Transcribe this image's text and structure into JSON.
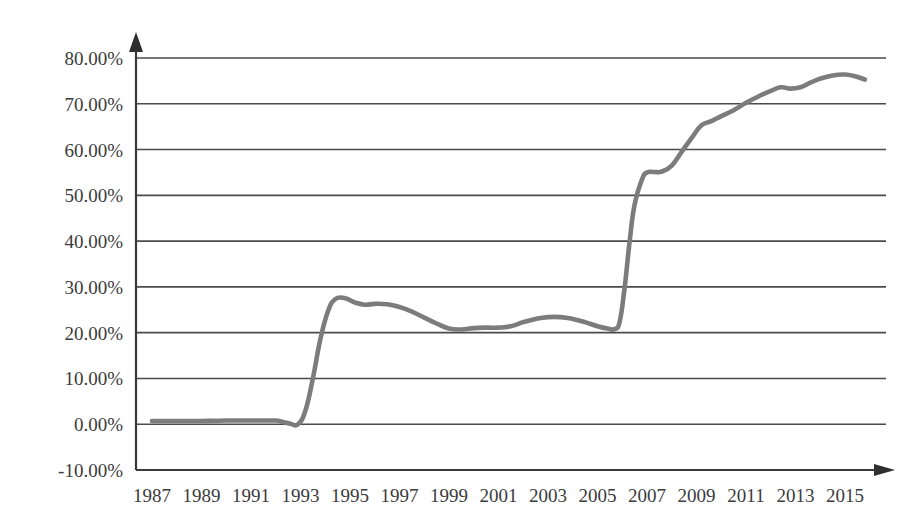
{
  "chart_data": {
    "type": "line",
    "title": "",
    "subtitle": "",
    "xlabel": "",
    "ylabel": "",
    "grid": true,
    "legend": false,
    "legend_position": "none",
    "xlim": [
      1986.5,
      2016.5
    ],
    "ylim": [
      -10,
      80
    ],
    "y_tick_step": 10,
    "x_tick_step": 2,
    "series_color": "#7c7c7c",
    "axis_color": "#3a3a3a",
    "gridline_color": "#4a4a4a",
    "y_tick_labels": [
      "80.00%",
      "70.00%",
      "60.00%",
      "50.00%",
      "40.00%",
      "30.00%",
      "20.00%",
      "10.00%",
      "0.00%",
      "-10.00%"
    ],
    "y_tick_values": [
      80,
      70,
      60,
      50,
      40,
      30,
      20,
      10,
      0,
      -10
    ],
    "x_tick_labels": [
      "1987",
      "1989",
      "1991",
      "1993",
      "1995",
      "1997",
      "1999",
      "2001",
      "2003",
      "2005",
      "2007",
      "2009",
      "2011",
      "2013",
      "2015"
    ],
    "x_tick_values": [
      1987,
      1989,
      1991,
      1993,
      1995,
      1997,
      1999,
      2001,
      2003,
      2005,
      2007,
      2009,
      2011,
      2013,
      2015
    ],
    "series": [
      {
        "name": "Series 1",
        "color": "#7c7c7c",
        "x": [
          1987,
          1987.5,
          1988,
          1988.5,
          1989,
          1989.5,
          1990,
          1990.5,
          1991,
          1991.5,
          1992,
          1992.3,
          1992.6,
          1992.9,
          1993.2,
          1993.5,
          1993.8,
          1994.1,
          1994.4,
          1994.8,
          1995.2,
          1995.6,
          1996,
          1996.5,
          1997,
          1997.5,
          1998,
          1998.5,
          1999,
          1999.5,
          2000,
          2000.5,
          2001,
          2001.5,
          2002,
          2002.5,
          2003,
          2003.5,
          2004,
          2004.5,
          2005,
          2005.4,
          2005.7,
          2005.9,
          2006.1,
          2006.3,
          2006.5,
          2006.8,
          2007,
          2007.3,
          2007.6,
          2008,
          2008.4,
          2008.8,
          2009.2,
          2009.6,
          2010,
          2010.5,
          2011,
          2011.5,
          2012,
          2012.4,
          2012.8,
          2013.2,
          2013.6,
          2014,
          2014.5,
          2015,
          2015.4,
          2015.8
        ],
        "values": [
          0.7,
          0.7,
          0.7,
          0.7,
          0.7,
          0.75,
          0.8,
          0.8,
          0.8,
          0.8,
          0.8,
          0.5,
          0.1,
          0.0,
          3.0,
          10.0,
          18.5,
          24.5,
          27.3,
          27.5,
          26.6,
          26.1,
          26.3,
          26.2,
          25.6,
          24.6,
          23.3,
          22.0,
          20.9,
          20.7,
          21.0,
          21.1,
          21.1,
          21.4,
          22.3,
          23.0,
          23.4,
          23.4,
          23.0,
          22.3,
          21.4,
          20.9,
          20.8,
          22.5,
          30.0,
          40.0,
          48.0,
          53.5,
          55.0,
          55.1,
          55.2,
          56.5,
          59.5,
          62.5,
          65.3,
          66.2,
          67.3,
          68.6,
          70.2,
          71.6,
          72.8,
          73.6,
          73.3,
          73.6,
          74.6,
          75.5,
          76.2,
          76.4,
          76.0,
          75.3
        ]
      }
    ]
  }
}
